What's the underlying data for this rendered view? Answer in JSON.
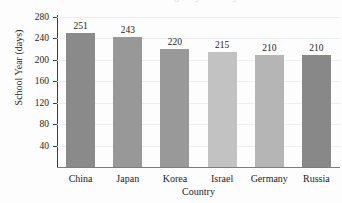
{
  "chart_data": {
    "type": "bar",
    "title": "",
    "title_remnant": "School Year Length by Country",
    "xlabel": "Country",
    "ylabel": "School Year (days)",
    "categories": [
      "China",
      "Japan",
      "Korea",
      "Israel",
      "Germany",
      "Russia"
    ],
    "values": [
      251,
      243,
      220,
      215,
      210,
      210
    ],
    "value_labels": [
      "251",
      "243",
      "220",
      "215",
      "210",
      "210"
    ],
    "bar_colors": [
      "#8a8a8a",
      "#989898",
      "#999999",
      "#c2c2c2",
      "#b5b5b5",
      "#888888"
    ],
    "ylim": [
      0,
      280
    ],
    "yticks": [
      280,
      240,
      200,
      160,
      120,
      80,
      40
    ],
    "ytick_labels": [
      "280",
      "240",
      "200",
      "160",
      "120",
      "80",
      "40"
    ],
    "grid": true,
    "grid_color": "#eceff1",
    "legend": "none",
    "axis_color": "#3a3a3a",
    "background": "#fdfdfd"
  }
}
